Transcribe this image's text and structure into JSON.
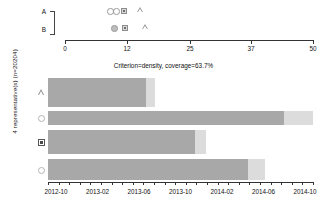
{
  "chart_data": {
    "type": "bar",
    "title": "Criterion=density, coverage=63.7%",
    "ylabel": "4 representative(s) (n=20204)",
    "xlabel": "",
    "orientation": "horizontal",
    "grid": false,
    "legend_position": "none",
    "categories": [
      "triangle",
      "circle-open-1",
      "square",
      "circle-open-2"
    ],
    "marker_shapes": [
      "triangle",
      "circle",
      "square",
      "circle"
    ],
    "x_axis": {
      "tick_labels": [
        "2012-10",
        "2013-02",
        "2013-06",
        "2013-10",
        "2014-02",
        "2014-06",
        "2014-10"
      ],
      "minor_ticks": 25,
      "range": [
        "2012-09",
        "2014-11"
      ]
    },
    "bars": [
      {
        "category": "triangle",
        "main_end": "2013-06",
        "tail_end": "2013-07"
      },
      {
        "category": "circle-open-1",
        "main_end": "2014-09",
        "tail_end": "2014-11"
      },
      {
        "category": "square",
        "main_end": "2013-10",
        "tail_end": "2013-11"
      },
      {
        "category": "circle-open-2",
        "main_end": "2014-05",
        "tail_end": "2014-06"
      }
    ],
    "bar_pixel_geometry": [
      {
        "x": 48,
        "y": 22,
        "main_width": 98,
        "tail_width": 9,
        "height": 29
      },
      {
        "x": 48,
        "y": 55,
        "main_width": 236,
        "tail_width": 29,
        "height": 14
      },
      {
        "x": 48,
        "y": 74,
        "main_width": 147,
        "tail_width": 11,
        "height": 24
      },
      {
        "x": 48,
        "y": 103,
        "main_width": 200,
        "tail_width": 17,
        "height": 21
      }
    ],
    "colors": {
      "bar_main": "#a8a8a8",
      "bar_tail": "#dcdcdc",
      "axis": "#333333",
      "text": "#111111"
    }
  },
  "top_panel": {
    "row_labels": [
      "A",
      "B"
    ],
    "axis_ticks": [
      "0",
      "12",
      "25",
      "37",
      "50"
    ],
    "axis_tick_positions": [
      65,
      127,
      190,
      251,
      313
    ],
    "row_a_markers": [
      {
        "shape": "circle",
        "filled": false,
        "x": 107
      },
      {
        "shape": "circle",
        "filled": false,
        "x": 113
      },
      {
        "shape": "square",
        "filled": true,
        "x": 120
      },
      {
        "shape": "triangle",
        "filled": false,
        "x": 135
      }
    ],
    "row_b_markers": [
      {
        "shape": "circle",
        "filled": true,
        "x": 111
      },
      {
        "shape": "square",
        "filled": true,
        "x": 121
      },
      {
        "shape": "triangle",
        "filled": false,
        "x": 140
      }
    ]
  }
}
